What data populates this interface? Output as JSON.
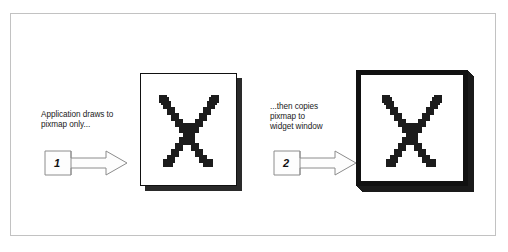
{
  "figure": {
    "name": "pixmap-to-widget-window-diagram",
    "frame": {
      "border_color": "#c2c2c2",
      "background": "#ffffff"
    }
  },
  "steps": [
    {
      "number": "1",
      "caption": "Application draws to\npixmap only...",
      "arrow_name": "step-arrow-1"
    },
    {
      "number": "2",
      "caption": "...then copies\npixmap to\nwidget window",
      "arrow_name": "step-arrow-2"
    }
  ],
  "objects": {
    "pixmap": {
      "label": "pixmap",
      "content_glyph": "aliased-letter-x",
      "border_color": "#111111",
      "shadow_color": "#2a2a2a",
      "background": "#ffffff"
    },
    "widget_window": {
      "label": "widget window",
      "content_glyph": "aliased-letter-x",
      "border_color": "#111111",
      "background": "#ffffff",
      "stack_layers": 6
    }
  },
  "colors": {
    "ink": "#1c1c1c",
    "frame_gray": "#c2c2c2",
    "arrow_outline": "#8c8c8c",
    "arrow_fill": "#fdfdfd",
    "paper": "#ffffff"
  }
}
